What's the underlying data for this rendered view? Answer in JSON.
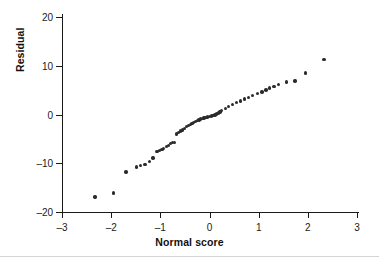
{
  "chart_data": {
    "type": "scatter",
    "title": "",
    "xlabel": "Normal score",
    "ylabel": "Residual",
    "xlim": [
      -3,
      3
    ],
    "ylim": [
      -20,
      20
    ],
    "xticks": [
      -3,
      -2,
      -1,
      0,
      1,
      2,
      3
    ],
    "yticks": [
      -20,
      -10,
      0,
      10,
      20
    ],
    "xtick_labels": [
      "–3",
      "–2",
      "–1",
      "0",
      "1",
      "2",
      "3"
    ],
    "ytick_labels": [
      "–20",
      "–10",
      "0",
      "10",
      "20"
    ],
    "grid": false,
    "legend": false,
    "marker_color": "#2b2b2b",
    "axis_color": "#1a1a1a",
    "background": "#ffffff",
    "series": [
      {
        "name": "Residuals",
        "x": [
          -2.33,
          -1.95,
          -1.7,
          -1.49,
          -1.4,
          -1.31,
          -1.22,
          -1.15,
          -1.07,
          -1.02,
          -0.97,
          -0.93,
          -0.88,
          -0.84,
          -0.79,
          -0.75,
          -0.71,
          -0.67,
          -0.63,
          -0.59,
          -0.55,
          -0.51,
          -0.47,
          -0.43,
          -0.39,
          -0.36,
          -0.32,
          -0.28,
          -0.25,
          -0.21,
          -0.18,
          -0.14,
          -0.11,
          -0.07,
          -0.04,
          0.0,
          0.04,
          0.07,
          0.11,
          0.14,
          0.18,
          0.21,
          0.25,
          0.32,
          0.39,
          0.47,
          0.55,
          0.63,
          0.71,
          0.79,
          0.88,
          0.97,
          1.07,
          1.15,
          1.22,
          1.31,
          1.4,
          1.56,
          1.74,
          1.95,
          2.33
        ],
        "y": [
          -16.9,
          -16.1,
          -11.8,
          -10.8,
          -10.5,
          -10.2,
          -9.6,
          -8.9,
          -7.6,
          -7.4,
          -7.2,
          -7.0,
          -6.6,
          -6.3,
          -6.0,
          -5.8,
          -5.7,
          -4.0,
          -3.7,
          -3.4,
          -3.2,
          -2.9,
          -2.5,
          -2.3,
          -2.0,
          -1.8,
          -1.6,
          -1.4,
          -1.2,
          -1.1,
          -0.9,
          -0.8,
          -0.7,
          -0.6,
          -0.5,
          -0.4,
          -0.3,
          -0.2,
          -0.1,
          0.1,
          0.3,
          0.5,
          0.8,
          1.2,
          1.7,
          2.1,
          2.5,
          2.8,
          3.2,
          3.5,
          3.9,
          4.3,
          4.6,
          5.0,
          5.4,
          5.8,
          6.2,
          6.7,
          6.9,
          8.5,
          11.3
        ]
      }
    ]
  }
}
